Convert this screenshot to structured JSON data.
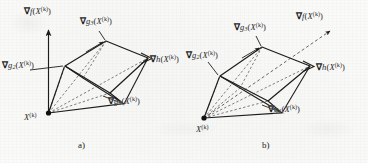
{
  "figure": {
    "background_color": "#fbfbfa",
    "ink_color": "#1d1d1d",
    "panels": [
      {
        "id": "a",
        "caption": "a)",
        "description": "Gradient of objective function lies outside the cone spanned by the constraint gradients",
        "vertex_label": "X",
        "vertex_superscript": "(k)",
        "labels": {
          "grad_f": "f(X",
          "grad_f_sub": "",
          "grad_g1": "g",
          "grad_g1_sub": "1",
          "grad_g2": "g",
          "grad_g2_sub": "2",
          "grad_g3": "g",
          "grad_g3_sub": "3",
          "grad_h": "h(X",
          "superscript": "(k)",
          "nabla": "∇",
          "open_paren": "(X",
          "close_paren": ")"
        }
      },
      {
        "id": "b",
        "caption": "b)",
        "description": "Gradient of objective function lies inside the cone spanned by the constraint gradients",
        "vertex_label": "X",
        "vertex_superscript": "(k)",
        "labels": {
          "grad_f": "f(X",
          "grad_g1": "g",
          "grad_g1_sub": "1",
          "grad_g2": "g",
          "grad_g2_sub": "2",
          "grad_g3": "g",
          "grad_g3_sub": "3",
          "grad_h": "h(X",
          "superscript": "(k)",
          "nabla": "∇"
        }
      }
    ]
  }
}
